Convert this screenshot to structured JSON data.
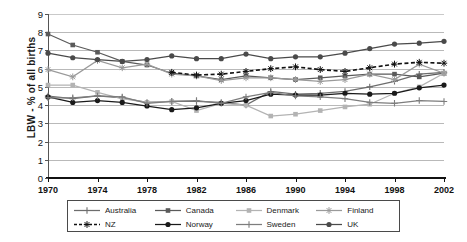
{
  "chart_data": {
    "type": "line",
    "title": "",
    "xlabel": "",
    "ylabel": "LBW - % of all births",
    "xlim": [
      1970,
      2002
    ],
    "ylim": [
      0,
      9
    ],
    "ytick_labels": [
      "0",
      "1",
      "2",
      "3",
      "4",
      "5",
      "6",
      "7",
      "8",
      "9"
    ],
    "xtick_labels": [
      "1970",
      "1974",
      "1978",
      "1982",
      "1986",
      "1990",
      "1994",
      "1998",
      "2002"
    ],
    "grid": true,
    "legend_position": "bottom",
    "x": [
      1970,
      1972,
      1974,
      1976,
      1978,
      1980,
      1982,
      1984,
      1986,
      1988,
      1990,
      1992,
      1994,
      1996,
      1998,
      2000,
      2002
    ],
    "series": [
      {
        "name": "Australia",
        "color": "#6d6d6d",
        "marker": "plus",
        "dash": "solid",
        "values": [
          4.5,
          4.35,
          4.5,
          4.4,
          4.15,
          4.2,
          4.2,
          4.15,
          4.0,
          4.75,
          4.6,
          4.65,
          4.75,
          5.0,
          5.3,
          5.7,
          5.8
        ]
      },
      {
        "name": "Canada",
        "color": "#5a5a5a",
        "marker": "square",
        "dash": "solid",
        "values": [
          7.9,
          7.3,
          6.9,
          6.4,
          6.2,
          5.75,
          5.6,
          5.4,
          5.6,
          5.5,
          5.4,
          5.5,
          5.6,
          5.7,
          5.7,
          5.55,
          5.75
        ]
      },
      {
        "name": "Denmark",
        "color": "#b3b3b3",
        "marker": "square",
        "dash": "solid",
        "values": [
          5.1,
          5.1,
          4.7,
          4.35,
          4.15,
          4.2,
          3.7,
          4.1,
          4.0,
          3.4,
          3.5,
          3.7,
          3.9,
          4.05,
          4.65,
          5.0,
          5.75
        ]
      },
      {
        "name": "Finland",
        "color": "#9a9a9a",
        "marker": "star",
        "dash": "solid",
        "values": [
          5.95,
          5.55,
          6.45,
          6.05,
          6.25,
          5.7,
          5.6,
          5.35,
          5.5,
          5.5,
          5.4,
          5.3,
          5.4,
          5.7,
          5.4,
          6.25,
          5.75
        ]
      },
      {
        "name": "NZ",
        "color": "#111111",
        "marker": "star",
        "dash": "dashed",
        "values": [
          null,
          null,
          null,
          null,
          null,
          5.8,
          5.65,
          5.7,
          5.85,
          6.0,
          6.1,
          5.95,
          5.85,
          6.05,
          6.25,
          6.35,
          6.3
        ]
      },
      {
        "name": "Norway",
        "color": "#1a1a1a",
        "marker": "circle",
        "dash": "solid",
        "values": [
          4.45,
          4.15,
          4.25,
          4.15,
          3.95,
          3.75,
          3.85,
          4.1,
          4.25,
          4.6,
          4.55,
          4.55,
          4.65,
          4.6,
          4.65,
          4.95,
          5.1
        ]
      },
      {
        "name": "Sweden",
        "color": "#7d7d7d",
        "marker": "plus",
        "dash": "solid",
        "values": [
          4.4,
          4.4,
          4.5,
          4.45,
          4.1,
          4.2,
          4.25,
          4.1,
          4.45,
          4.7,
          4.5,
          4.45,
          4.35,
          4.15,
          4.1,
          4.25,
          4.2
        ]
      },
      {
        "name": "UK",
        "color": "#4a4a4a",
        "marker": "circle",
        "dash": "solid",
        "values": [
          6.85,
          6.6,
          6.5,
          6.4,
          6.5,
          6.7,
          6.55,
          6.55,
          6.8,
          6.55,
          6.65,
          6.65,
          6.85,
          7.1,
          7.35,
          7.4,
          7.5
        ]
      }
    ]
  },
  "legend": {
    "rows": [
      [
        "Australia",
        "Canada",
        "Denmark",
        "Finland"
      ],
      [
        "NZ",
        "Norway",
        "Sweden",
        "UK"
      ]
    ]
  }
}
